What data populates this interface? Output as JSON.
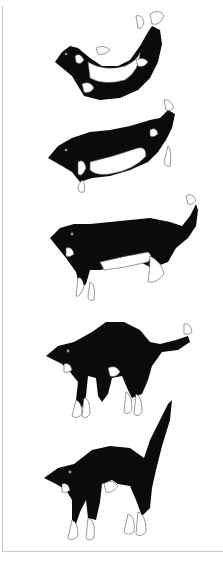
{
  "figure": {
    "caption_cropped": "",
    "stages": [
      {
        "id": 1,
        "pose": "upside-down, curled"
      },
      {
        "id": 2,
        "pose": "twisting, front turned"
      },
      {
        "id": 3,
        "pose": "horizontal, legs extending"
      },
      {
        "id": 4,
        "pose": "arched, legs down"
      },
      {
        "id": 5,
        "pose": "landing stance, tail up"
      }
    ],
    "colors": {
      "fur": "#0b0b0b",
      "patches": "#ffffff",
      "border": "#c8c8c8"
    }
  }
}
